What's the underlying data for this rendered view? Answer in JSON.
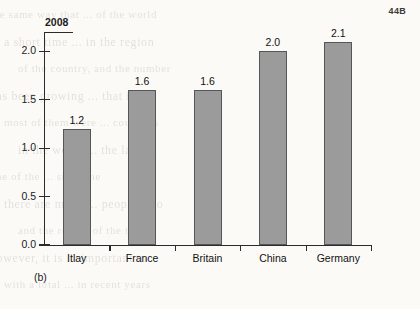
{
  "page_marker": "44B",
  "caption": "(b)",
  "chart_data": {
    "type": "bar",
    "title": "2008",
    "xlabel": "",
    "ylabel": "",
    "categories": [
      "Itlay",
      "France",
      "Britain",
      "China",
      "Germany"
    ],
    "values": [
      1.2,
      1.6,
      1.6,
      2.0,
      2.1
    ],
    "value_labels": [
      "1.2",
      "1.6",
      "1.6",
      "2.0",
      "2.1"
    ],
    "ylim": [
      0.0,
      2.2
    ],
    "yticks": [
      0.0,
      0.5,
      1.0,
      1.5,
      2.0
    ],
    "ytick_labels": [
      "0.0",
      "0.5",
      "1.0",
      "1.5",
      "2.0"
    ],
    "grid": false,
    "legend": "none",
    "bar_color": "#9b9b9b",
    "bar_edge_color": "#55565a",
    "axis_color": "#2b2b2b"
  },
  "bleed_text": [
    "the same way that ... of the world",
    "a short time ... in the region",
    "of the country, and the number",
    "has been growing ... that it",
    "most of them were ... countries",
    "in the world ... the largest",
    "one of the ... since the",
    "there are many ... people who",
    "and the rest ... of the time",
    "however, it is ... important to",
    "with a total ... in recent years"
  ]
}
